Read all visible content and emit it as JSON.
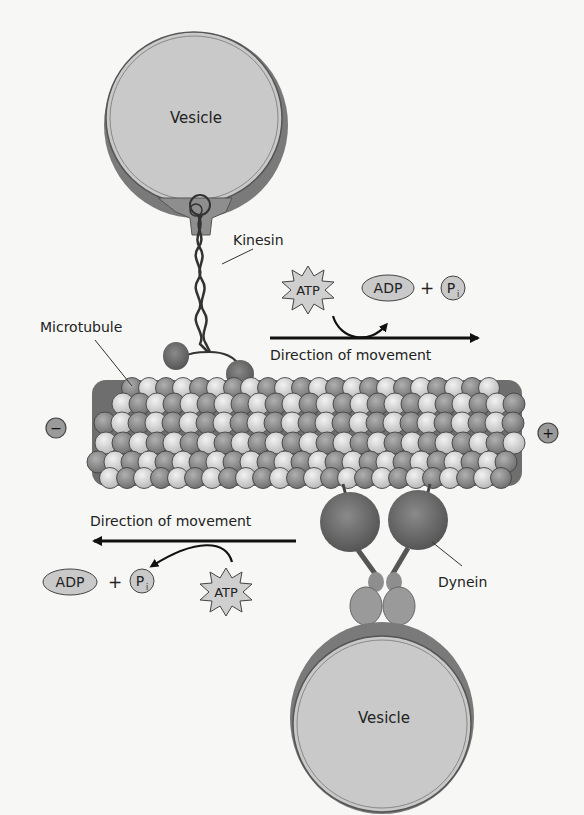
{
  "diagram": {
    "labels": {
      "vesicle_top": "Vesicle",
      "vesicle_bottom": "Vesicle",
      "kinesin": "Kinesin",
      "dynein": "Dynein",
      "microtubule": "Microtubule",
      "minus_end": "−",
      "plus_end": "+"
    },
    "kinesin_reaction": {
      "reactant": "ATP",
      "product_1": "ADP",
      "plus": "+",
      "product_2_base": "P",
      "product_2_sub": "i",
      "direction_label": "Direction of movement",
      "direction": "right (toward + end)"
    },
    "dynein_reaction": {
      "reactant": "ATP",
      "product_1": "ADP",
      "plus": "+",
      "product_2_base": "P",
      "product_2_sub": "i",
      "direction_label": "Direction of movement",
      "direction": "left (toward − end)"
    },
    "colors": {
      "vesicle_fill": "#c9c9c9",
      "vesicle_rim": "#6e6e6e",
      "motor_head": "#6a6a6a",
      "tubulin_light": "#d4d4d4",
      "tubulin_dark": "#8e8e8e",
      "arrow": "#111111"
    }
  }
}
